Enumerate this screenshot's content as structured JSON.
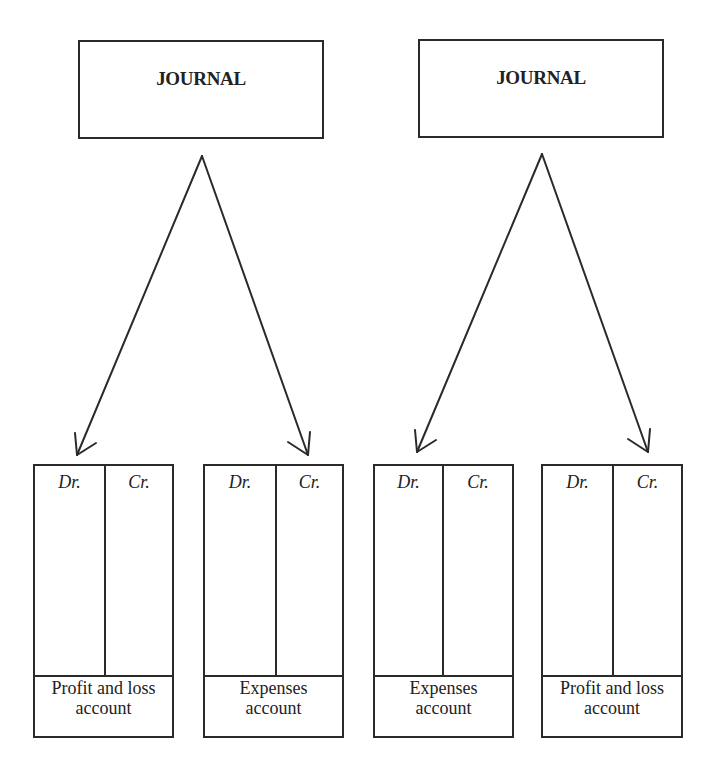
{
  "diagram": {
    "left_group": {
      "journal": {
        "title": "JOURNAL"
      },
      "ledgers": [
        {
          "debit_label": "Dr.",
          "credit_label": "Cr.",
          "name_line1": "Profit and loss",
          "name_line2": "account"
        },
        {
          "debit_label": "Dr.",
          "credit_label": "Cr.",
          "name_line1": "Expenses",
          "name_line2": "account"
        }
      ]
    },
    "right_group": {
      "journal": {
        "title": "JOURNAL"
      },
      "ledgers": [
        {
          "debit_label": "Dr.",
          "credit_label": "Cr.",
          "name_line1": "Expenses",
          "name_line2": "account"
        },
        {
          "debit_label": "Dr.",
          "credit_label": "Cr.",
          "name_line1": "Profit and loss",
          "name_line2": "account"
        }
      ]
    },
    "colors": {
      "stroke": "#2a2a2a",
      "text": "#222222",
      "background": "#ffffff"
    }
  }
}
